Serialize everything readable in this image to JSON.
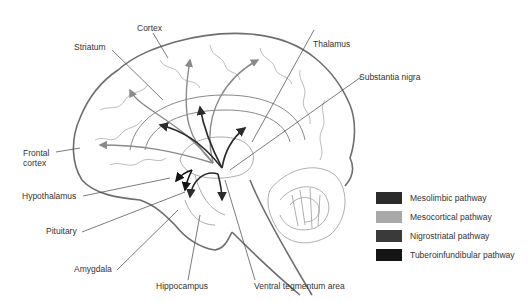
{
  "diagram": {
    "labels": {
      "cortex": "Cortex",
      "striatum": "Striatum",
      "thalamus": "Thalamus",
      "substantia_nigra": "Substantia nigra",
      "frontal_cortex_line1": "Frontal",
      "frontal_cortex_line2": "cortex",
      "hypothalamus": "Hypothalamus",
      "pituitary": "Pituitary",
      "amygdala": "Amygdala",
      "hippocampus": "Hippocampus",
      "ventral_tegmentum_area": "Ventral tegmentum area"
    },
    "legend": [
      {
        "label": "Mesolimbic pathway",
        "color": "#2b2b2b"
      },
      {
        "label": "Mesocortical pathway",
        "color": "#a8a8a8"
      },
      {
        "label": "Nigrostriatal pathway",
        "color": "#3a3a3a"
      },
      {
        "label": "Tuberoinfundibular pathway",
        "color": "#141414"
      }
    ],
    "colors": {
      "outline": "#6e6e6e",
      "gyri": "#9a9a9a",
      "leader": "#444444",
      "mesolimbic": "#2b2b2b",
      "mesocortical": "#8a8a8a",
      "nigrostriatal": "#3a3a3a",
      "tuberoinfundibular": "#141414"
    }
  }
}
